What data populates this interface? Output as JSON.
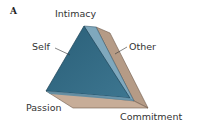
{
  "figure": {
    "panel_label": "A",
    "type": "triangular prism (triangle of love)",
    "vertices": {
      "top": "Intimacy",
      "bottom_left": "Passion",
      "bottom_right": "Commitment"
    },
    "faces": {
      "front": "Self",
      "back": "Other"
    },
    "colors": {
      "front_face": "#2f6680",
      "front_face_dark": "#24566e",
      "side_face": "#7fa8bd",
      "back_face": "#b59b86",
      "bottom_face": "#c7ad98",
      "label_text": "#333333"
    }
  }
}
